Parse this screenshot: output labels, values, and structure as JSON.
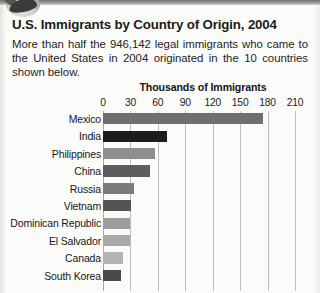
{
  "document": {
    "title": "U.S. Immigrants by Country of Origin, 2004",
    "intro": "More than half the 946,142 legal immigrants who came to the United States in 2004 originated in the 10 countries shown below."
  },
  "chart_data": {
    "type": "bar",
    "orientation": "horizontal",
    "title": "U.S. Immigrants by Country of Origin, 2004",
    "xlabel": "Thousands of Immigrants",
    "ylabel": "",
    "xlim": [
      0,
      210
    ],
    "xticks": [
      "0",
      "30",
      "60",
      "90",
      "120",
      "150",
      "180",
      "210"
    ],
    "grid": "vertical",
    "legend": "none",
    "units": "thousands of immigrants",
    "categories": [
      "Mexico",
      "India",
      "Philippines",
      "China",
      "Russia",
      "Vietnam",
      "Dominican Republic",
      "El Salvador",
      "Canada",
      "South Korea"
    ],
    "values": [
      175,
      70,
      57,
      51,
      34,
      31,
      30,
      30,
      22,
      20
    ],
    "bar_colors": [
      "#6f6f6d",
      "#1d1d1d",
      "#8e8e8c",
      "#5d5d5b",
      "#7c7c7a",
      "#545452",
      "#9c9c9a",
      "#a9a9a7",
      "#b4b4b2",
      "#4a4a48"
    ]
  },
  "axis": {
    "tick_positions": [
      0,
      30,
      60,
      90,
      120,
      150,
      180,
      210
    ]
  }
}
